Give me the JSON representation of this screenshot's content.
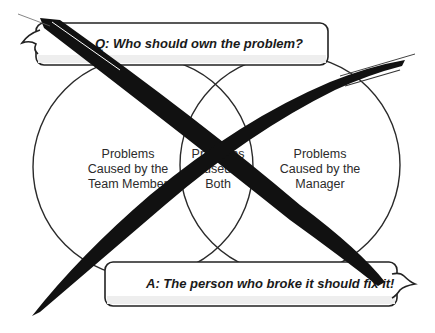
{
  "question_bubble": {
    "text": "Q: Who should own the problem?"
  },
  "answer_bubble": {
    "text": "A: The person who broke it should fix it!"
  },
  "venn": {
    "left": {
      "lines": [
        "Problems",
        "Caused by the",
        "Team Member"
      ]
    },
    "center": {
      "lines": [
        "Problems",
        "Caused by",
        "Both"
      ]
    },
    "right": {
      "lines": [
        "Problems",
        "Caused by the",
        "Manager"
      ]
    }
  },
  "overlay": {
    "icon": "cross-out-x-icon",
    "color": "#111111"
  },
  "colors": {
    "outline": "#2a2a2a",
    "background": "#ffffff",
    "text": "#2b2b2b"
  }
}
